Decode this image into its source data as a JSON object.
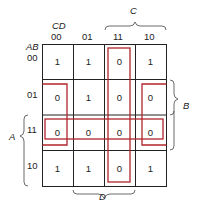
{
  "kmap": {
    "col_var_label": "CD",
    "row_var_label": "AB",
    "col_headers": [
      "00",
      "01",
      "11",
      "10"
    ],
    "row_headers": [
      "00",
      "01",
      "11",
      "10"
    ],
    "cells": [
      [
        "1",
        "1",
        "0",
        "1"
      ],
      [
        "0",
        "1",
        "0",
        "0"
      ],
      [
        "0",
        "0",
        "0",
        "0"
      ],
      [
        "1",
        "1",
        "0",
        "1"
      ]
    ],
    "brace_labels": {
      "C": "C",
      "D": "D",
      "A": "A",
      "B": "B"
    },
    "groups": [
      {
        "name": "column-11-group",
        "cells": [
          [
            0,
            2
          ],
          [
            1,
            2
          ],
          [
            2,
            2
          ],
          [
            3,
            2
          ]
        ]
      },
      {
        "name": "row-11-group",
        "cells": [
          [
            2,
            0
          ],
          [
            2,
            1
          ],
          [
            2,
            2
          ],
          [
            2,
            3
          ]
        ]
      },
      {
        "name": "wrap-corner-group",
        "cells": [
          [
            1,
            0
          ],
          [
            2,
            0
          ],
          [
            1,
            3
          ],
          [
            2,
            3
          ]
        ]
      }
    ],
    "colors": {
      "grid": "#222222",
      "group_outline": "#b0262b"
    }
  }
}
